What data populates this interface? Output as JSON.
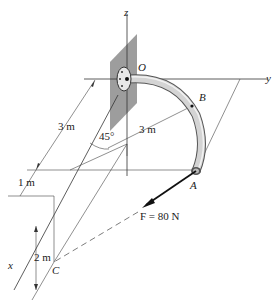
{
  "axes": {
    "x": "x",
    "y": "y",
    "z": "z"
  },
  "points": {
    "origin": "O",
    "A": "A",
    "B": "B",
    "C": "C"
  },
  "dimensions": {
    "vertical_3m": "3 m",
    "radius_3m": "3 m",
    "angle": "45°",
    "offset_1m": "1 m",
    "height_2m": "2 m"
  },
  "force": {
    "label": "F = 80 N",
    "magnitude": 80,
    "unit": "N"
  },
  "colors": {
    "line": "#333333",
    "plate": "#8a8a8a",
    "pipe": "#c8c8c8",
    "pipe_edge": "#555555"
  }
}
